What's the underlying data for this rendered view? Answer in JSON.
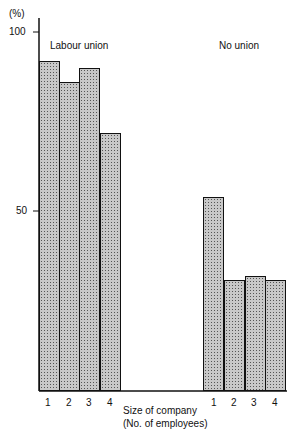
{
  "chart_data": {
    "type": "bar",
    "title": "",
    "ylabel": "(%)",
    "xlabel": "Size of company\n(No. of employees)",
    "ylim": [
      0,
      100
    ],
    "yticks": [
      50,
      100
    ],
    "grid": false,
    "groups": [
      "Labour union",
      "No union"
    ],
    "categories": [
      "1",
      "2",
      "3",
      "4"
    ],
    "series": [
      {
        "name": "Labour union",
        "values": [
          92,
          86,
          90,
          72
        ]
      },
      {
        "name": "No union",
        "values": [
          54,
          31,
          32,
          31
        ]
      }
    ]
  },
  "labels": {
    "y_unit": "(%)",
    "tick_100": "100",
    "tick_50": "50",
    "group_labour": "Labour union",
    "group_none": "No union",
    "xlabel_line1": "Size of company",
    "xlabel_line2": "(No. of employees)",
    "cat": [
      "1",
      "2",
      "3",
      "4"
    ]
  }
}
